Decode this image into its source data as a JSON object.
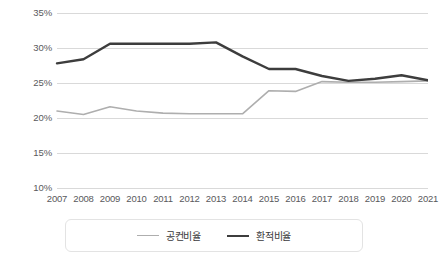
{
  "chart_data": {
    "type": "line",
    "title": "",
    "subtitle": "",
    "xlabel": "",
    "ylabel": "",
    "categories": [
      "2007",
      "2008",
      "2009",
      "2010",
      "2011",
      "2012",
      "2013",
      "2014",
      "2015",
      "2016",
      "2017",
      "2018",
      "2019",
      "2020",
      "2021"
    ],
    "x": [
      2007,
      2008,
      2009,
      2010,
      2011,
      2012,
      2013,
      2014,
      2015,
      2016,
      2017,
      2018,
      2019,
      2020,
      2021
    ],
    "series": [
      {
        "name": "공컨비율",
        "color": "#aeaeae",
        "line_width": 1.6,
        "values": [
          21.0,
          20.5,
          21.6,
          21.0,
          20.7,
          20.6,
          20.6,
          20.6,
          23.9,
          23.8,
          25.2,
          25.1,
          25.1,
          25.2,
          25.3
        ]
      },
      {
        "name": "환적비율",
        "color": "#3d3d3d",
        "line_width": 2.4,
        "values": [
          27.8,
          28.4,
          30.6,
          30.6,
          30.6,
          30.6,
          30.8,
          28.8,
          27.0,
          27.0,
          26.0,
          25.3,
          25.6,
          26.1,
          25.4
        ]
      }
    ],
    "ylim": [
      10,
      35
    ],
    "ytick_values": [
      35,
      30,
      25,
      20,
      15,
      10
    ],
    "ytick_labels": [
      "35%",
      "30%",
      "25%",
      "20%",
      "15%",
      "10%"
    ],
    "grid": true,
    "grid_color": "#d9d9d9",
    "legend_position": "bottom"
  },
  "legend": {
    "items": [
      {
        "label": "공컨비율"
      },
      {
        "label": "환적비율"
      }
    ]
  }
}
